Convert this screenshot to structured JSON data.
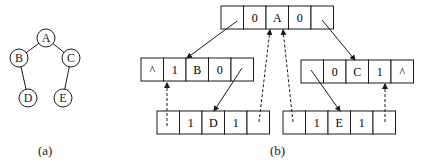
{
  "figure": {
    "tree": {
      "caption": "(a)",
      "nodes": [
        {
          "id": "A",
          "label": "A",
          "cx": 46,
          "cy": 38
        },
        {
          "id": "B",
          "label": "B",
          "cx": 19,
          "cy": 58
        },
        {
          "id": "C",
          "label": "C",
          "cx": 71,
          "cy": 58
        },
        {
          "id": "D",
          "label": "D",
          "cx": 28,
          "cy": 98
        },
        {
          "id": "E",
          "label": "E",
          "cx": 63,
          "cy": 98
        }
      ],
      "edges": [
        [
          "A",
          "B"
        ],
        [
          "A",
          "C"
        ],
        [
          "B",
          "D"
        ],
        [
          "C",
          "E"
        ]
      ]
    },
    "threaded": {
      "caption": "(b)",
      "nodes": [
        {
          "id": "A",
          "x": 221,
          "y": 6,
          "cells": [
            "",
            "0",
            "A",
            "0",
            ""
          ]
        },
        {
          "id": "B",
          "x": 141,
          "y": 58,
          "cells": [
            "^",
            "1",
            "B",
            "0",
            ""
          ]
        },
        {
          "id": "C",
          "x": 301,
          "y": 60,
          "cells": [
            "",
            "0",
            "C",
            "1",
            "^"
          ]
        },
        {
          "id": "D",
          "x": 157,
          "y": 111,
          "cells": [
            "",
            "1",
            "D",
            "1",
            ""
          ]
        },
        {
          "id": "E",
          "x": 283,
          "y": 111,
          "cells": [
            "",
            "1",
            "E",
            "1",
            ""
          ]
        }
      ],
      "child_links": [
        [
          "A",
          "B"
        ],
        [
          "A",
          "C"
        ],
        [
          "B",
          "D"
        ],
        [
          "C",
          "E"
        ]
      ],
      "thread_links": [
        [
          "D",
          "B"
        ],
        [
          "D",
          "A"
        ],
        [
          "E",
          "A"
        ],
        [
          "E",
          "C"
        ]
      ]
    }
  }
}
